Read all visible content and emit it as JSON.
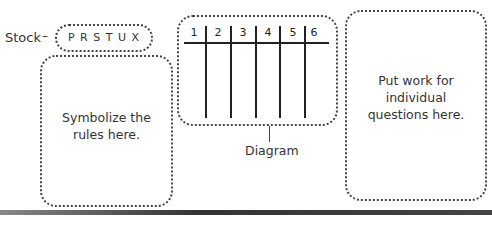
{
  "stock": {
    "label": "Stock",
    "connector": "¬",
    "items": "P R S T U X"
  },
  "rules_box": {
    "text_line1": "Symbolize the",
    "text_line2": "rules here."
  },
  "diagram": {
    "columns": [
      "1",
      "2",
      "3",
      "4",
      "5",
      "6"
    ],
    "caption": "Diagram"
  },
  "work_box": {
    "text_line1": "Put work for individual",
    "text_line2": "questions here."
  }
}
